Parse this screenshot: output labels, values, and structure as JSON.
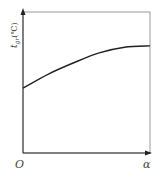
{
  "chart_data": {
    "type": "line",
    "title": "",
    "xlabel": "α",
    "ylabel": "t_gr(℃)",
    "origin_label": "O",
    "x": [
      0,
      0.2,
      0.4,
      0.6,
      0.8,
      1.0
    ],
    "series": [
      {
        "name": "t_gr",
        "values": [
          0.46,
          0.56,
          0.64,
          0.71,
          0.75,
          0.76
        ]
      }
    ],
    "xlim": [
      0,
      1
    ],
    "ylim": [
      0,
      1
    ],
    "grid": false,
    "legend": "none"
  },
  "labels": {
    "origin": "O",
    "x_axis": "α",
    "y_axis_main": "t",
    "y_axis_sub": "gr",
    "y_axis_unit": "(℃)"
  }
}
